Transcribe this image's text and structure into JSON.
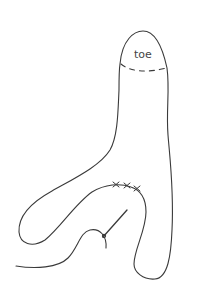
{
  "diagram": {
    "labels": {
      "toe": "toe"
    },
    "colors": {
      "stroke": "#3a3a3a",
      "background": "#ffffff",
      "text": "#444444"
    },
    "parts": [
      {
        "name": "sock-outline",
        "description": "Sock shape outline"
      },
      {
        "name": "toe-seam",
        "description": "Dashed line marking toe section"
      },
      {
        "name": "heel-stitches",
        "description": "Cross stitches along heel curve"
      },
      {
        "name": "yarn",
        "description": "Yarn tail curving from left"
      },
      {
        "name": "needle",
        "description": "Darning needle"
      }
    ]
  }
}
